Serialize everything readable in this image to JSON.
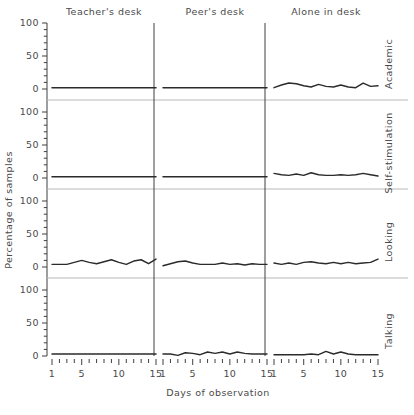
{
  "chart_data": {
    "type": "line",
    "title": "",
    "xlabel": "Days of observation",
    "ylabel": "Percentage of samples",
    "xlim": [
      1,
      15
    ],
    "ylim": [
      0,
      100
    ],
    "xticks": [
      1,
      5,
      10,
      15
    ],
    "xticklabels": [
      "1",
      "5",
      "10",
      "15"
    ],
    "yticks": [
      0,
      50,
      100
    ],
    "yticklabels": [
      "0",
      "50",
      "100"
    ],
    "minor_tick_interval": 10,
    "grid": false,
    "legend": "none",
    "layout": "small-multiples 4 rows x 3 columns",
    "columns": [
      "Teacher's desk",
      "Peer's desk",
      "Alone in desk"
    ],
    "rows": [
      "Academic",
      "Self-stimulation",
      "Looking",
      "Talking"
    ],
    "x": [
      1,
      2,
      3,
      4,
      5,
      6,
      7,
      8,
      9,
      10,
      11,
      12,
      13,
      14,
      15
    ],
    "panels": [
      {
        "row": "Academic",
        "column": "Teacher's desk",
        "values": [
          2,
          2,
          2,
          2,
          2,
          2,
          2,
          2,
          2,
          2,
          2,
          2,
          2,
          2,
          2
        ]
      },
      {
        "row": "Academic",
        "column": "Peer's desk",
        "values": [
          2,
          2,
          2,
          2,
          2,
          2,
          2,
          2,
          2,
          2,
          2,
          2,
          2,
          2,
          2
        ]
      },
      {
        "row": "Academic",
        "column": "Alone in desk",
        "values": [
          2,
          6,
          9,
          8,
          5,
          3,
          7,
          4,
          3,
          6,
          3,
          2,
          9,
          4,
          5
        ]
      },
      {
        "row": "Self-stimulation",
        "column": "Teacher's desk",
        "values": [
          2,
          2,
          2,
          2,
          2,
          2,
          2,
          2,
          2,
          2,
          2,
          2,
          2,
          2,
          2
        ]
      },
      {
        "row": "Self-stimulation",
        "column": "Peer's desk",
        "values": [
          2,
          2,
          2,
          2,
          2,
          2,
          2,
          2,
          2,
          2,
          2,
          2,
          2,
          2,
          2
        ]
      },
      {
        "row": "Self-stimulation",
        "column": "Alone in desk",
        "values": [
          7,
          5,
          4,
          6,
          4,
          8,
          5,
          4,
          4,
          5,
          4,
          5,
          7,
          5,
          3
        ]
      },
      {
        "row": "Looking",
        "column": "Teacher's desk",
        "values": [
          4,
          4,
          4,
          7,
          10,
          7,
          5,
          8,
          11,
          7,
          4,
          9,
          11,
          5,
          12
        ]
      },
      {
        "row": "Looking",
        "column": "Peer's desk",
        "values": [
          2,
          5,
          8,
          9,
          6,
          4,
          4,
          4,
          6,
          4,
          5,
          3,
          5,
          4,
          4
        ]
      },
      {
        "row": "Looking",
        "column": "Alone in desk",
        "values": [
          6,
          4,
          6,
          4,
          7,
          8,
          6,
          5,
          7,
          5,
          7,
          5,
          6,
          7,
          12
        ]
      },
      {
        "row": "Talking",
        "column": "Teacher's desk",
        "values": [
          3,
          3,
          3,
          3,
          3,
          3,
          3,
          3,
          3,
          3,
          3,
          3,
          3,
          3,
          3
        ]
      },
      {
        "row": "Talking",
        "column": "Peer's desk",
        "values": [
          3,
          3,
          1,
          5,
          4,
          2,
          6,
          4,
          6,
          3,
          6,
          4,
          3,
          3,
          3
        ]
      },
      {
        "row": "Talking",
        "column": "Alone in desk",
        "values": [
          2,
          2,
          2,
          2,
          2,
          3,
          2,
          7,
          3,
          6,
          3,
          2,
          2,
          2,
          2
        ]
      }
    ]
  },
  "axes": {
    "ylabel": "Percentage of samples",
    "xlabel": "Days of observation",
    "ytick_labels": [
      "100",
      "50",
      "0"
    ],
    "xtick_labels": [
      "1",
      "5",
      "10",
      "15"
    ]
  },
  "columns": [
    {
      "label": "Teacher's desk"
    },
    {
      "label": "Peer's desk"
    },
    {
      "label": "Alone in desk"
    }
  ],
  "rows": [
    {
      "label": "Academic"
    },
    {
      "label": "Self-stimulation"
    },
    {
      "label": "Looking"
    },
    {
      "label": "Talking"
    }
  ],
  "colors": {
    "dataline": "#2b2b2b",
    "axis": "#3f3f3f",
    "rowrule": "#b9b9b9",
    "text": "#4a4a4a",
    "background": "#ffffff"
  }
}
